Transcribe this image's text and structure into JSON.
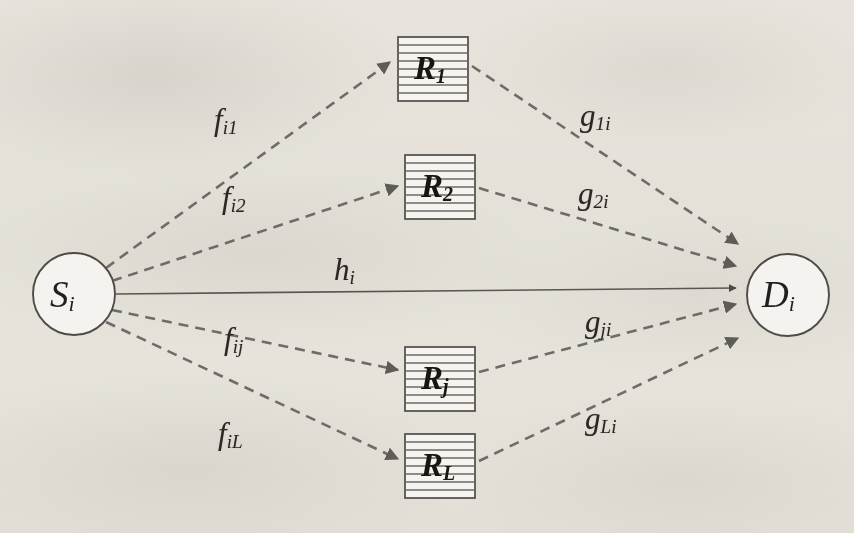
{
  "diagram": {
    "type": "node-link-diagram",
    "background_color": "#f3f1ed",
    "line_color": "#6f6c68",
    "solid_line_color": "#57534f",
    "text_color": "#231f1c"
  },
  "nodes": {
    "source": {
      "id": "S_i",
      "base": "S",
      "sub": "i",
      "shape": "circle",
      "cx": 74,
      "cy": 294,
      "r": 41
    },
    "destination": {
      "id": "D_i",
      "base": "D",
      "sub": "i",
      "shape": "circle",
      "cx": 788,
      "cy": 295,
      "r": 41
    },
    "relays": [
      {
        "id": "R_1",
        "base": "R",
        "sub": "1",
        "shape": "striped-box",
        "x": 398,
        "y": 37,
        "w": 70,
        "h": 64,
        "stripes": 8
      },
      {
        "id": "R_2",
        "base": "R",
        "sub": "2",
        "shape": "striped-box",
        "x": 405,
        "y": 155,
        "w": 70,
        "h": 64,
        "stripes": 8
      },
      {
        "id": "R_j",
        "base": "R",
        "sub": "j",
        "shape": "striped-box",
        "x": 405,
        "y": 347,
        "w": 70,
        "h": 64,
        "stripes": 8
      },
      {
        "id": "R_L",
        "base": "R",
        "sub": "L",
        "shape": "striped-box",
        "x": 405,
        "y": 434,
        "w": 70,
        "h": 64,
        "stripes": 8
      }
    ]
  },
  "edges": [
    {
      "id": "edge-s-r1",
      "from": "S_i",
      "to": "R_1",
      "style": "dashed",
      "arrow": true,
      "label": {
        "base": "f",
        "sub": "i1",
        "x": 214,
        "y": 104
      },
      "x1": 106,
      "y1": 268,
      "x2": 390,
      "y2": 62
    },
    {
      "id": "edge-s-r2",
      "from": "S_i",
      "to": "R_2",
      "style": "dashed",
      "arrow": true,
      "label": {
        "base": "f",
        "sub": "i2",
        "x": 222,
        "y": 182
      },
      "x1": 112,
      "y1": 281,
      "x2": 398,
      "y2": 186
    },
    {
      "id": "edge-s-d",
      "from": "S_i",
      "to": "D_i",
      "style": "solid",
      "arrow": true,
      "label": {
        "base": "h",
        "sub": "i",
        "x": 334,
        "y": 254
      },
      "x1": 116,
      "y1": 294,
      "x2": 736,
      "y2": 288
    },
    {
      "id": "edge-s-rj",
      "from": "S_i",
      "to": "R_j",
      "style": "dashed",
      "arrow": true,
      "label": {
        "base": "f",
        "sub": "ij",
        "x": 224,
        "y": 323
      },
      "x1": 112,
      "y1": 310,
      "x2": 398,
      "y2": 370
    },
    {
      "id": "edge-s-rl",
      "from": "S_i",
      "to": "R_L",
      "style": "dashed",
      "arrow": true,
      "label": {
        "base": "f",
        "sub": "iL",
        "x": 218,
        "y": 418
      },
      "x1": 106,
      "y1": 322,
      "x2": 398,
      "y2": 459
    },
    {
      "id": "edge-r1-d",
      "from": "R_1",
      "to": "D_i",
      "style": "dashed",
      "arrow": true,
      "label": {
        "base": "g",
        "sub": "1i",
        "x": 580,
        "y": 100
      },
      "x1": 472,
      "y1": 66,
      "x2": 738,
      "y2": 244
    },
    {
      "id": "edge-r2-d",
      "from": "R_2",
      "to": "D_i",
      "style": "dashed",
      "arrow": true,
      "label": {
        "base": "g",
        "sub": "2i",
        "x": 578,
        "y": 178
      },
      "x1": 479,
      "y1": 188,
      "x2": 736,
      "y2": 266
    },
    {
      "id": "edge-rj-d",
      "from": "R_j",
      "to": "D_i",
      "style": "dashed",
      "arrow": true,
      "label": {
        "base": "g",
        "sub": "ji",
        "x": 585,
        "y": 306
      },
      "x1": 479,
      "y1": 372,
      "x2": 736,
      "y2": 304
    },
    {
      "id": "edge-rl-d",
      "from": "R_L",
      "to": "D_i",
      "style": "dashed",
      "arrow": true,
      "label": {
        "base": "g",
        "sub": "Li",
        "x": 585,
        "y": 403
      },
      "x1": 479,
      "y1": 461,
      "x2": 738,
      "y2": 338
    }
  ]
}
